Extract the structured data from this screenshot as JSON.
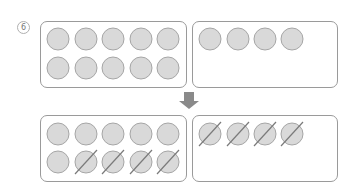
{
  "problem": {
    "number_label": "6",
    "number_glyph": "⑥"
  },
  "before": {
    "left_box": {
      "rows": 2,
      "cols": 5,
      "count": 10,
      "crossed": []
    },
    "right_box": {
      "count": 4,
      "crossed": []
    }
  },
  "arrow": {
    "direction": "down",
    "icon": "arrow-down-icon"
  },
  "after": {
    "left_box": {
      "rows": 2,
      "cols": 5,
      "count": 10,
      "crossed_count": 4,
      "crossed_positions": "row 2, columns 2-5"
    },
    "right_box": {
      "count": 4,
      "crossed_count": 4
    }
  },
  "colors": {
    "circle_fill": "#d9d9d9",
    "circle_stroke": "#a6a6a6",
    "box_border": "#9a9a9a",
    "arrow": "#8a8a8a",
    "slash": "#7a7a7a"
  }
}
